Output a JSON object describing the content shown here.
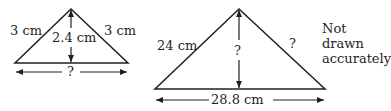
{
  "diagram": {
    "small_triangle": {
      "left_side": "3 cm",
      "right_side": "3 cm",
      "height": "2.4 cm",
      "base": "?"
    },
    "large_triangle": {
      "left_side": "24 cm",
      "right_side": "?",
      "height": "?",
      "base": "28.8 cm"
    },
    "note_line1": "Not drawn",
    "note_line2": "accurately"
  },
  "colors": {
    "stroke": "#231f20",
    "background": "#ffffff"
  }
}
